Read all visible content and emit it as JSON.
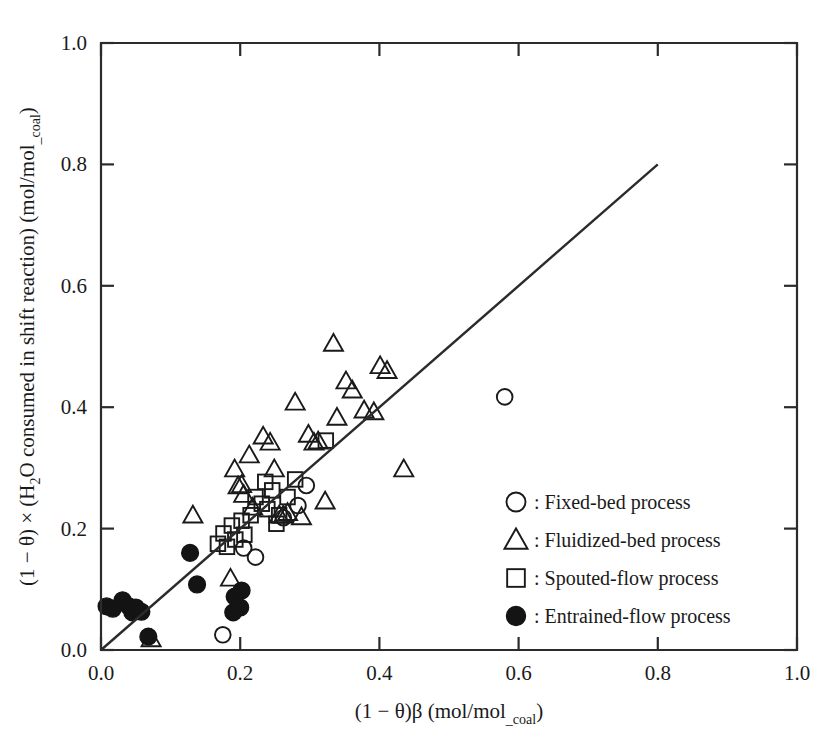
{
  "chart_data": {
    "type": "scatter",
    "title": "",
    "xlabel": "(1 − θ)β (mol/mol_coal)",
    "ylabel": "(1 − θ) × (H₂O consumed in shift reaction) (mol/mol_coal)",
    "xlim": [
      0.0,
      1.0
    ],
    "ylim": [
      0.0,
      1.0
    ],
    "xticks": [
      "0.0",
      "0.2",
      "0.4",
      "0.6",
      "0.8",
      "1.0"
    ],
    "yticks": [
      "0.0",
      "0.2",
      "0.4",
      "0.6",
      "0.8",
      "1.0"
    ],
    "xtick_values": [
      0.0,
      0.2,
      0.4,
      0.6,
      0.8,
      1.0
    ],
    "ytick_values": [
      0.0,
      0.2,
      0.4,
      0.6,
      0.8,
      1.0
    ],
    "grid": false,
    "legend_position": "center-right",
    "annotation_line": {
      "label": "parity line (y = x)",
      "x": [
        0.0,
        0.8
      ],
      "y": [
        0.0,
        0.8
      ]
    },
    "series": [
      {
        "name": "Fixed-bed process",
        "marker": "open-circle",
        "color": "#1a1a1a",
        "points": [
          [
            0.175,
            0.025
          ],
          [
            0.205,
            0.168
          ],
          [
            0.222,
            0.153
          ],
          [
            0.262,
            0.218
          ],
          [
            0.283,
            0.238
          ],
          [
            0.295,
            0.271
          ],
          [
            0.58,
            0.417
          ]
        ]
      },
      {
        "name": "Fluidized-bed process",
        "marker": "open-triangle",
        "color": "#1a1a1a",
        "points": [
          [
            0.072,
            0.018
          ],
          [
            0.132,
            0.222
          ],
          [
            0.186,
            0.118
          ],
          [
            0.192,
            0.298
          ],
          [
            0.197,
            0.27
          ],
          [
            0.202,
            0.272
          ],
          [
            0.205,
            0.256
          ],
          [
            0.213,
            0.321
          ],
          [
            0.218,
            0.235
          ],
          [
            0.233,
            0.352
          ],
          [
            0.243,
            0.342
          ],
          [
            0.249,
            0.298
          ],
          [
            0.256,
            0.222
          ],
          [
            0.262,
            0.222
          ],
          [
            0.268,
            0.226
          ],
          [
            0.279,
            0.408
          ],
          [
            0.288,
            0.219
          ],
          [
            0.298,
            0.355
          ],
          [
            0.306,
            0.342
          ],
          [
            0.312,
            0.344
          ],
          [
            0.322,
            0.245
          ],
          [
            0.334,
            0.505
          ],
          [
            0.339,
            0.383
          ],
          [
            0.352,
            0.443
          ],
          [
            0.361,
            0.428
          ],
          [
            0.378,
            0.395
          ],
          [
            0.392,
            0.392
          ],
          [
            0.401,
            0.468
          ],
          [
            0.411,
            0.46
          ],
          [
            0.435,
            0.298
          ]
        ]
      },
      {
        "name": "Spouted-flow process",
        "marker": "open-square",
        "color": "#1a1a1a",
        "points": [
          [
            0.168,
            0.175
          ],
          [
            0.176,
            0.192
          ],
          [
            0.181,
            0.17
          ],
          [
            0.188,
            0.205
          ],
          [
            0.193,
            0.182
          ],
          [
            0.202,
            0.213
          ],
          [
            0.206,
            0.19
          ],
          [
            0.215,
            0.222
          ],
          [
            0.222,
            0.252
          ],
          [
            0.231,
            0.241
          ],
          [
            0.236,
            0.277
          ],
          [
            0.239,
            0.232
          ],
          [
            0.246,
            0.263
          ],
          [
            0.252,
            0.208
          ],
          [
            0.256,
            0.222
          ],
          [
            0.268,
            0.252
          ],
          [
            0.279,
            0.281
          ],
          [
            0.323,
            0.345
          ]
        ]
      },
      {
        "name": "Entrained-flow process",
        "marker": "filled-circle",
        "color": "#141414",
        "points": [
          [
            0.008,
            0.072
          ],
          [
            0.017,
            0.068
          ],
          [
            0.031,
            0.082
          ],
          [
            0.04,
            0.072
          ],
          [
            0.045,
            0.062
          ],
          [
            0.05,
            0.07
          ],
          [
            0.058,
            0.063
          ],
          [
            0.068,
            0.022
          ],
          [
            0.128,
            0.16
          ],
          [
            0.138,
            0.108
          ],
          [
            0.19,
            0.062
          ],
          [
            0.192,
            0.088
          ],
          [
            0.2,
            0.07
          ],
          [
            0.202,
            0.098
          ]
        ]
      }
    ]
  },
  "legend": {
    "items": [
      {
        "marker": "open-circle",
        "separator": ":",
        "label": "Fixed-bed process"
      },
      {
        "marker": "open-triangle",
        "separator": ":",
        "label": "Fluidized-bed process"
      },
      {
        "marker": "open-square",
        "separator": ":",
        "label": "Spouted-flow process"
      },
      {
        "marker": "filled-circle",
        "separator": ":",
        "label": "Entrained-flow process"
      }
    ]
  },
  "axis_title_parts": {
    "x_main": "(1 − θ)β (mol/mol",
    "x_sub": "_coal",
    "x_tail": ")",
    "y_main": "(1 − θ) × (H",
    "y_sub1": "2",
    "y_main2": "O consumed in shift reaction) (mol/mol",
    "y_sub2": "_coal",
    "y_tail": ")"
  }
}
